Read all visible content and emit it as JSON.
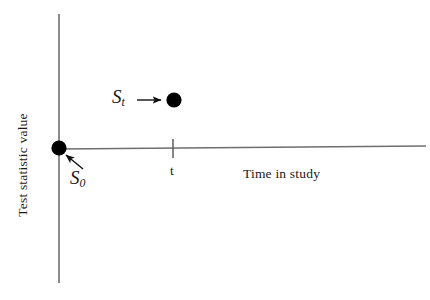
{
  "figure": {
    "type": "diagram",
    "background_color": "#ffffff",
    "axis_color": "#6e6e6e",
    "marker_color": "#000000",
    "text_color": "#1a1a1a"
  },
  "axes": {
    "y": {
      "label": "Test statistic value",
      "orientation": "vertical",
      "x_position": 59,
      "top": 14,
      "bottom": 283,
      "ticks": [],
      "tick_labels": []
    },
    "x": {
      "label": "Time in study",
      "orientation": "horizontal",
      "y_position_left": 149,
      "y_position_right": 146,
      "left": 59,
      "right": 426,
      "ticks": [
        {
          "label": "t",
          "x_position": 173
        }
      ]
    }
  },
  "markers": [
    {
      "name": "origin-statistic",
      "label": "S",
      "subscript": "0",
      "x": 59,
      "y": 148,
      "radius": 7.5,
      "annotation_arrow": "points up-left from label to marker"
    },
    {
      "name": "time-t-statistic",
      "label": "S",
      "subscript": "t",
      "x": 174,
      "y": 100,
      "radius": 7.5,
      "annotation_arrow": "points right from label to marker"
    }
  ],
  "labels": {
    "y_axis": "Test statistic value",
    "x_axis": "Time in study",
    "tick_t": "t",
    "s_zero_base": "S",
    "s_zero_sub": "0",
    "s_t_base": "S",
    "s_t_sub": "t"
  }
}
